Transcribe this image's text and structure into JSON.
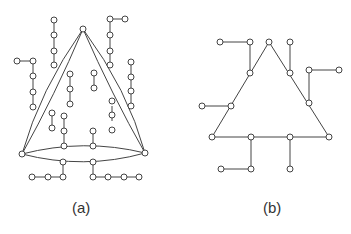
{
  "figures": [
    {
      "id": "a",
      "label": "(a)"
    },
    {
      "id": "b",
      "label": "(b)"
    }
  ],
  "colors": {
    "stroke": "#444444",
    "background": "#ffffff"
  }
}
